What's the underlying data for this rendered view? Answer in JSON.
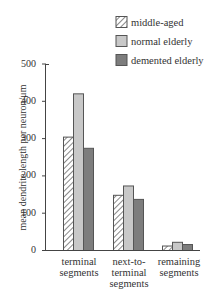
{
  "chart_data": {
    "type": "bar",
    "title": "",
    "xlabel": "",
    "ylabel": "mean dendrite length per neuron/μm",
    "ylim": [
      0,
      500
    ],
    "yticks": [
      0,
      100,
      200,
      300,
      400,
      500
    ],
    "grid": false,
    "legend_position": "top-right",
    "categories": [
      "terminal segments",
      "next-to-terminal segments",
      "remaining segments"
    ],
    "category_labels": [
      [
        "terminal",
        "segments"
      ],
      [
        "next-to-",
        "terminal",
        "segments"
      ],
      [
        "remaining",
        "segments"
      ]
    ],
    "series": [
      {
        "name": "middle-aged",
        "pattern": "hatched",
        "color": "#ffffff",
        "values": [
          304,
          148,
          12
        ]
      },
      {
        "name": "normal elderly",
        "pattern": "solid",
        "color": "#c8c8c8",
        "values": [
          420,
          173,
          22
        ]
      },
      {
        "name": "demented elderly",
        "pattern": "solid",
        "color": "#7d7d7d",
        "values": [
          274,
          137,
          16
        ]
      }
    ]
  },
  "legend": {
    "items": [
      {
        "label": "middle-aged"
      },
      {
        "label": "normal elderly"
      },
      {
        "label": "demented elderly"
      }
    ]
  },
  "axis": {
    "y_ticks": [
      "0",
      "100",
      "200",
      "300",
      "400",
      "500"
    ],
    "y_label": "mean dendrite length per neuron/μm"
  }
}
